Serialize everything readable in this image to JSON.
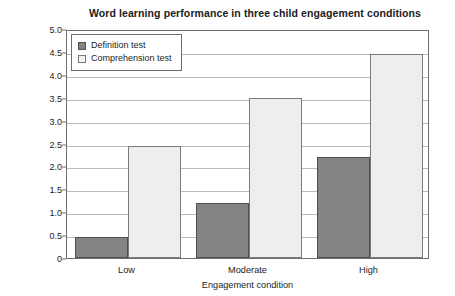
{
  "chart_data": {
    "type": "bar",
    "title": "Word learning performance in three child engagement conditions",
    "xlabel": "Engagement condition",
    "ylabel_line1": "Information units per word: definition test",
    "ylabel_line2": "Words correct: comprehension test",
    "categories": [
      "Low",
      "Moderate",
      "High"
    ],
    "series": [
      {
        "name": "Definition test",
        "values": [
          0.45,
          1.2,
          2.2
        ],
        "color": "#848484"
      },
      {
        "name": "Comprehension test",
        "values": [
          2.45,
          3.5,
          4.45
        ],
        "color": "#eeeeee"
      }
    ],
    "ylim": [
      0,
      5.0
    ],
    "ytick_labels": [
      "0",
      "0.5",
      "1.0",
      "1.5",
      "2.0",
      "2.5",
      "3.0",
      "3.5",
      "4.0",
      "4.5",
      "5.0"
    ],
    "ytick_values": [
      0,
      0.5,
      1.0,
      1.5,
      2.0,
      2.5,
      3.0,
      3.5,
      4.0,
      4.5,
      5.0
    ],
    "grid": true,
    "legend_position": "top-left"
  }
}
